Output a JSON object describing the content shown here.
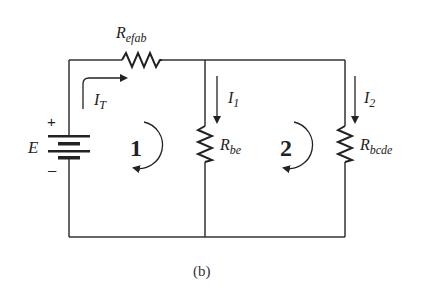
{
  "figure": {
    "caption": "(b)",
    "source": {
      "name": "E",
      "plus": "+",
      "minus": "–"
    },
    "resistors": {
      "r_efab": {
        "main": "R",
        "sub": "efab"
      },
      "r_be": {
        "main": "R",
        "sub": "be"
      },
      "r_bcde": {
        "main": "R",
        "sub": "bcde"
      }
    },
    "currents": {
      "it": {
        "main": "I",
        "sub": "T"
      },
      "i1": {
        "main": "I",
        "sub": "1"
      },
      "i2": {
        "main": "I",
        "sub": "2"
      }
    },
    "loops": {
      "loop1": "1",
      "loop2": "2"
    },
    "colors": {
      "wire": "#333333",
      "background": "#ffffff"
    }
  }
}
